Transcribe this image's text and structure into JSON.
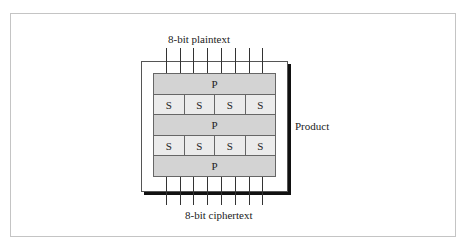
{
  "diagram": {
    "input_label": "8-bit plaintext",
    "output_label": "8-bit ciphertext",
    "side_label": "Product",
    "wire_count": 8,
    "rows": [
      {
        "type": "P",
        "boxes": [
          "P"
        ]
      },
      {
        "type": "S",
        "boxes": [
          "S",
          "S",
          "S",
          "S"
        ]
      },
      {
        "type": "P",
        "boxes": [
          "P"
        ]
      },
      {
        "type": "S",
        "boxes": [
          "S",
          "S",
          "S",
          "S"
        ]
      },
      {
        "type": "P",
        "boxes": [
          "P"
        ]
      }
    ],
    "colors": {
      "p_box": "#d3d3d3",
      "s_box": "#ebebeb",
      "shadow": "#111111",
      "frame": "#c4c4c4"
    }
  }
}
